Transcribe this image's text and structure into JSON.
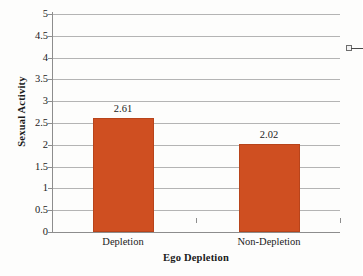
{
  "chart_data": {
    "type": "bar",
    "title": "",
    "subtitle": "",
    "xlabel": "Ego Depletion",
    "ylabel": "Sexual Activity",
    "categories": [
      "Depletion",
      "Non-Depletion"
    ],
    "values": [
      2.61,
      2.02
    ],
    "value_labels": [
      "2.61",
      "2.02"
    ],
    "series": [
      {
        "name": "",
        "values": [
          2.61,
          2.02
        ],
        "color": "#cf4f21"
      }
    ],
    "ylim": [
      0,
      5
    ],
    "y_tick_step": 0.5,
    "y_ticks": [
      5,
      4.5,
      4,
      3.5,
      3,
      2.5,
      2,
      1.5,
      1,
      0.5,
      0
    ],
    "y_tick_labels": [
      "5",
      "4.5",
      "4",
      "3.5",
      "3",
      "2.5",
      "2",
      "1.5",
      "1",
      "0.5",
      "0"
    ],
    "grid": true,
    "grid_axis": "y",
    "legend": "cut-off-right-edge",
    "legend_position": "right",
    "bar_color": "#cf4f21",
    "grid_color": "#b4b4b4",
    "axis_color": "#8d8d8d"
  },
  "legend": {
    "marker_label": ""
  }
}
